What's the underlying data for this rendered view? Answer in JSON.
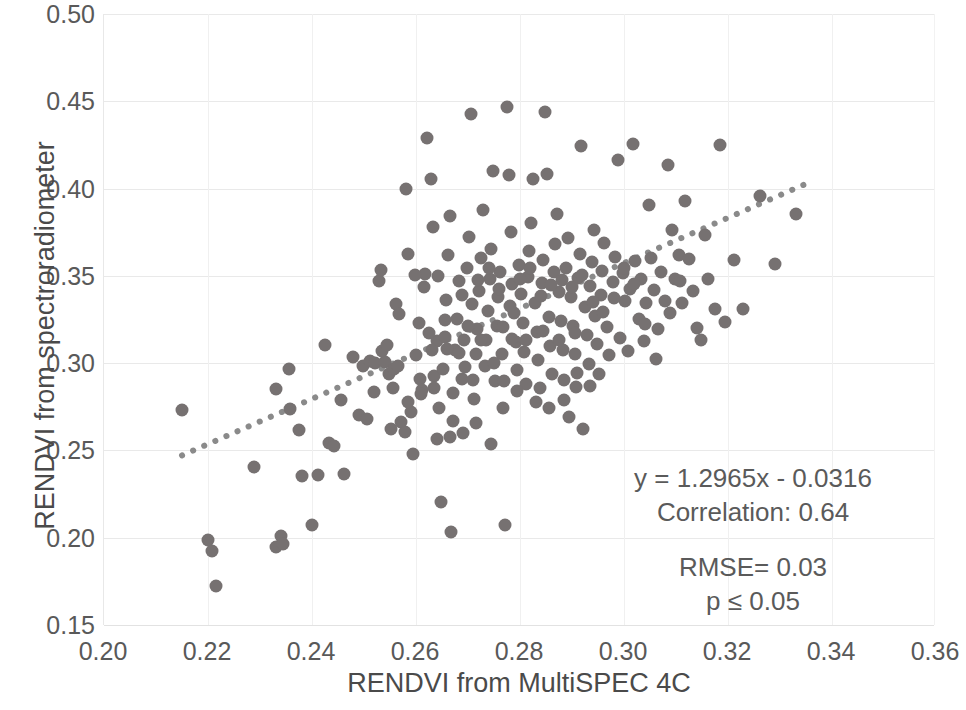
{
  "chart_data": {
    "type": "scatter",
    "title": "",
    "xlabel": "RENDVI from MultiSPEC 4C",
    "ylabel": "RENDVI from spectroradiometer",
    "xlim": [
      0.2,
      0.36
    ],
    "ylim": [
      0.15,
      0.5
    ],
    "xticks": [
      "0.20",
      "0.22",
      "0.24",
      "0.26",
      "0.28",
      "0.30",
      "0.32",
      "0.34",
      "0.36"
    ],
    "yticks": [
      "0.15",
      "0.20",
      "0.25",
      "0.30",
      "0.35",
      "0.40",
      "0.45",
      "0.50"
    ],
    "xtick_values": [
      0.2,
      0.22,
      0.24,
      0.26,
      0.28,
      0.3,
      0.32,
      0.34,
      0.36
    ],
    "ytick_values": [
      0.15,
      0.2,
      0.25,
      0.3,
      0.35,
      0.4,
      0.45,
      0.5
    ],
    "grid": true,
    "legend": "none",
    "marker_color": "#767171",
    "marker_size": 13,
    "trendline": {
      "style": "dotted",
      "color": "#8a8a8a",
      "slope": 1.2965,
      "intercept": -0.0316,
      "x_start": 0.215,
      "x_end": 0.3355
    },
    "annotations": {
      "equation": "y = 1.2965x - 0.0316",
      "correlation": "Correlation: 0.64",
      "rmse": "RMSE= 0.03",
      "pvalue": "p ≤ 0.05"
    },
    "points": [
      [
        0.215,
        0.273
      ],
      [
        0.22,
        0.1985
      ],
      [
        0.2208,
        0.1925
      ],
      [
        0.2215,
        0.1722
      ],
      [
        0.2288,
        0.2405
      ],
      [
        0.233,
        0.1945
      ],
      [
        0.234,
        0.201
      ],
      [
        0.2345,
        0.1965
      ],
      [
        0.233,
        0.285
      ],
      [
        0.2355,
        0.2965
      ],
      [
        0.2358,
        0.274
      ],
      [
        0.2375,
        0.2615
      ],
      [
        0.238,
        0.2355
      ],
      [
        0.2412,
        0.236
      ],
      [
        0.24,
        0.207
      ],
      [
        0.2425,
        0.3105
      ],
      [
        0.2432,
        0.2545
      ],
      [
        0.2442,
        0.2525
      ],
      [
        0.2455,
        0.279
      ],
      [
        0.2462,
        0.2365
      ],
      [
        0.2478,
        0.3035
      ],
      [
        0.249,
        0.2705
      ],
      [
        0.2498,
        0.2985
      ],
      [
        0.2505,
        0.268
      ],
      [
        0.2512,
        0.3015
      ],
      [
        0.2522,
        0.3
      ],
      [
        0.2528,
        0.347
      ],
      [
        0.2532,
        0.3535
      ],
      [
        0.254,
        0.3005
      ],
      [
        0.2548,
        0.2935
      ],
      [
        0.2552,
        0.262
      ],
      [
        0.2558,
        0.2965
      ],
      [
        0.2562,
        0.334
      ],
      [
        0.2568,
        0.328
      ],
      [
        0.2572,
        0.2665
      ],
      [
        0.2578,
        0.2605
      ],
      [
        0.258,
        0.3995
      ],
      [
        0.2585,
        0.3625
      ],
      [
        0.259,
        0.272
      ],
      [
        0.2595,
        0.248
      ],
      [
        0.26,
        0.3045
      ],
      [
        0.2605,
        0.323
      ],
      [
        0.2608,
        0.291
      ],
      [
        0.2612,
        0.2845
      ],
      [
        0.2618,
        0.351
      ],
      [
        0.2622,
        0.429
      ],
      [
        0.2628,
        0.4055
      ],
      [
        0.2632,
        0.378
      ],
      [
        0.2635,
        0.2925
      ],
      [
        0.264,
        0.3125
      ],
      [
        0.2645,
        0.2745
      ],
      [
        0.2648,
        0.2205
      ],
      [
        0.2652,
        0.2965
      ],
      [
        0.2655,
        0.315
      ],
      [
        0.2658,
        0.336
      ],
      [
        0.2662,
        0.362
      ],
      [
        0.2665,
        0.3845
      ],
      [
        0.2668,
        0.2035
      ],
      [
        0.2672,
        0.283
      ],
      [
        0.2675,
        0.3075
      ],
      [
        0.2678,
        0.3255
      ],
      [
        0.2682,
        0.347
      ],
      [
        0.2688,
        0.291
      ],
      [
        0.2692,
        0.3135
      ],
      [
        0.2695,
        0.298
      ],
      [
        0.2698,
        0.3545
      ],
      [
        0.2702,
        0.372
      ],
      [
        0.2705,
        0.4425
      ],
      [
        0.2708,
        0.334
      ],
      [
        0.2712,
        0.2795
      ],
      [
        0.2715,
        0.305
      ],
      [
        0.2718,
        0.3195
      ],
      [
        0.2722,
        0.3415
      ],
      [
        0.2725,
        0.36
      ],
      [
        0.2728,
        0.388
      ],
      [
        0.2732,
        0.2985
      ],
      [
        0.2735,
        0.313
      ],
      [
        0.2738,
        0.33
      ],
      [
        0.2742,
        0.348
      ],
      [
        0.2745,
        0.3655
      ],
      [
        0.2748,
        0.41
      ],
      [
        0.2752,
        0.2895
      ],
      [
        0.2755,
        0.321
      ],
      [
        0.2758,
        0.338
      ],
      [
        0.2762,
        0.352
      ],
      [
        0.2765,
        0.305
      ],
      [
        0.2768,
        0.2745
      ],
      [
        0.2772,
        0.2075
      ],
      [
        0.2775,
        0.4465
      ],
      [
        0.2778,
        0.4075
      ],
      [
        0.2782,
        0.375
      ],
      [
        0.2785,
        0.3455
      ],
      [
        0.2788,
        0.3285
      ],
      [
        0.2792,
        0.312
      ],
      [
        0.2795,
        0.296
      ],
      [
        0.2798,
        0.3565
      ],
      [
        0.2802,
        0.3395
      ],
      [
        0.2805,
        0.323
      ],
      [
        0.2808,
        0.3065
      ],
      [
        0.2812,
        0.288
      ],
      [
        0.2815,
        0.3495
      ],
      [
        0.2818,
        0.364
      ],
      [
        0.2822,
        0.3805
      ],
      [
        0.2825,
        0.4055
      ],
      [
        0.2828,
        0.3345
      ],
      [
        0.2832,
        0.318
      ],
      [
        0.2835,
        0.302
      ],
      [
        0.2838,
        0.2855
      ],
      [
        0.2842,
        0.346
      ],
      [
        0.2845,
        0.359
      ],
      [
        0.2848,
        0.444
      ],
      [
        0.2852,
        0.4085
      ],
      [
        0.2855,
        0.3265
      ],
      [
        0.2858,
        0.31
      ],
      [
        0.2862,
        0.2935
      ],
      [
        0.2865,
        0.352
      ],
      [
        0.2868,
        0.368
      ],
      [
        0.2872,
        0.3855
      ],
      [
        0.2875,
        0.3405
      ],
      [
        0.2878,
        0.324
      ],
      [
        0.2882,
        0.3075
      ],
      [
        0.2885,
        0.2905
      ],
      [
        0.2888,
        0.3545
      ],
      [
        0.2892,
        0.3715
      ],
      [
        0.2895,
        0.269
      ],
      [
        0.2898,
        0.338
      ],
      [
        0.2902,
        0.3215
      ],
      [
        0.2905,
        0.305
      ],
      [
        0.2908,
        0.2865
      ],
      [
        0.2912,
        0.349
      ],
      [
        0.2915,
        0.3625
      ],
      [
        0.2918,
        0.4245
      ],
      [
        0.2922,
        0.262
      ],
      [
        0.2925,
        0.332
      ],
      [
        0.2928,
        0.316
      ],
      [
        0.2932,
        0.2995
      ],
      [
        0.2935,
        0.344
      ],
      [
        0.2938,
        0.358
      ],
      [
        0.2942,
        0.376
      ],
      [
        0.2945,
        0.327
      ],
      [
        0.2948,
        0.311
      ],
      [
        0.2952,
        0.2935
      ],
      [
        0.2955,
        0.339
      ],
      [
        0.2958,
        0.353
      ],
      [
        0.2962,
        0.369
      ],
      [
        0.2968,
        0.3205
      ],
      [
        0.2972,
        0.3045
      ],
      [
        0.2978,
        0.3465
      ],
      [
        0.2982,
        0.361
      ],
      [
        0.2988,
        0.4165
      ],
      [
        0.2992,
        0.3145
      ],
      [
        0.2998,
        0.3515
      ],
      [
        0.3002,
        0.3355
      ],
      [
        0.3008,
        0.307
      ],
      [
        0.3012,
        0.3425
      ],
      [
        0.3018,
        0.4255
      ],
      [
        0.3022,
        0.3585
      ],
      [
        0.3028,
        0.3255
      ],
      [
        0.3032,
        0.348
      ],
      [
        0.3038,
        0.3125
      ],
      [
        0.3042,
        0.3345
      ],
      [
        0.3048,
        0.3905
      ],
      [
        0.3052,
        0.36
      ],
      [
        0.3058,
        0.342
      ],
      [
        0.3065,
        0.3195
      ],
      [
        0.3072,
        0.352
      ],
      [
        0.3078,
        0.3355
      ],
      [
        0.3085,
        0.4135
      ],
      [
        0.3092,
        0.376
      ],
      [
        0.3098,
        0.348
      ],
      [
        0.3105,
        0.362
      ],
      [
        0.3112,
        0.3345
      ],
      [
        0.3118,
        0.393
      ],
      [
        0.3125,
        0.3595
      ],
      [
        0.3132,
        0.3415
      ],
      [
        0.314,
        0.32
      ],
      [
        0.3148,
        0.3135
      ],
      [
        0.3155,
        0.3735
      ],
      [
        0.3162,
        0.348
      ],
      [
        0.3175,
        0.331
      ],
      [
        0.3185,
        0.425
      ],
      [
        0.3195,
        0.3235
      ],
      [
        0.3212,
        0.359
      ],
      [
        0.3228,
        0.331
      ],
      [
        0.3262,
        0.3955
      ],
      [
        0.329,
        0.357
      ],
      [
        0.333,
        0.3855
      ],
      [
        0.2535,
        0.307
      ],
      [
        0.2545,
        0.3105
      ],
      [
        0.2565,
        0.2985
      ],
      [
        0.2598,
        0.3505
      ],
      [
        0.2615,
        0.3435
      ],
      [
        0.263,
        0.3075
      ],
      [
        0.2642,
        0.35
      ],
      [
        0.266,
        0.308
      ],
      [
        0.2682,
        0.306
      ],
      [
        0.27,
        0.321
      ],
      [
        0.272,
        0.3475
      ],
      [
        0.274,
        0.3545
      ],
      [
        0.276,
        0.3425
      ],
      [
        0.278,
        0.3325
      ],
      [
        0.28,
        0.348
      ],
      [
        0.282,
        0.3545
      ],
      [
        0.284,
        0.3385
      ],
      [
        0.286,
        0.345
      ],
      [
        0.288,
        0.3475
      ],
      [
        0.29,
        0.3435
      ],
      [
        0.292,
        0.3505
      ],
      [
        0.294,
        0.335
      ],
      [
        0.296,
        0.3295
      ],
      [
        0.298,
        0.3375
      ],
      [
        0.3,
        0.3545
      ],
      [
        0.302,
        0.3455
      ],
      [
        0.304,
        0.3225
      ],
      [
        0.264,
        0.2565
      ],
      [
        0.2665,
        0.2575
      ],
      [
        0.269,
        0.26
      ],
      [
        0.2715,
        0.2655
      ],
      [
        0.2745,
        0.2535
      ],
      [
        0.277,
        0.29
      ],
      [
        0.2795,
        0.284
      ],
      [
        0.283,
        0.2775
      ],
      [
        0.2855,
        0.2745
      ],
      [
        0.2885,
        0.279
      ],
      [
        0.291,
        0.2945
      ],
      [
        0.2935,
        0.287
      ],
      [
        0.252,
        0.2835
      ],
      [
        0.2555,
        0.2855
      ],
      [
        0.2585,
        0.2775
      ],
      [
        0.261,
        0.2825
      ],
      [
        0.2635,
        0.2855
      ],
      [
        0.2672,
        0.267
      ],
      [
        0.271,
        0.2905
      ],
      [
        0.275,
        0.3
      ],
      [
        0.2785,
        0.314
      ],
      [
        0.2625,
        0.317
      ],
      [
        0.2655,
        0.3245
      ],
      [
        0.2688,
        0.339
      ],
      [
        0.2725,
        0.3135
      ],
      [
        0.2768,
        0.3205
      ],
      [
        0.2812,
        0.3135
      ],
      [
        0.2845,
        0.3185
      ],
      [
        0.2875,
        0.3135
      ],
      [
        0.2905,
        0.3175
      ],
      [
        0.3062,
        0.3025
      ],
      [
        0.3088,
        0.329
      ],
      [
        0.3108,
        0.347
      ]
    ]
  }
}
